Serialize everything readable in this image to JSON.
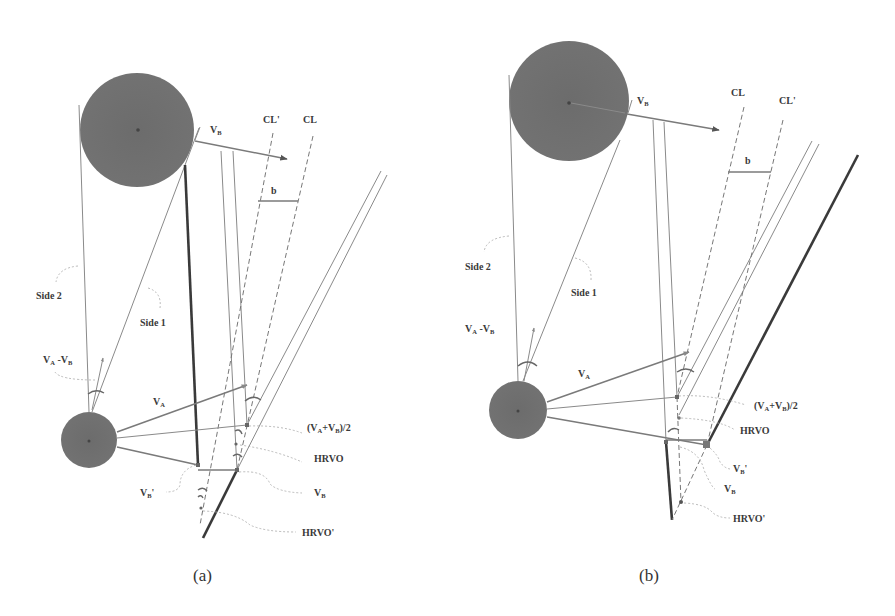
{
  "diagram": {
    "colors": {
      "agent_fill": "#6f6f6f",
      "line": "#8a8a8a",
      "thick_line": "#3a3a3a",
      "text": "#3a3a3a",
      "background": "#ffffff"
    },
    "panels": [
      {
        "caption": "(a)",
        "labels": {
          "vb_top": "V",
          "vb_top_sub": "B",
          "cl_prime": "CL'",
          "cl": "CL",
          "b": "b",
          "side2": "Side 2",
          "side1": "Side 1",
          "va_minus_vb": "V",
          "va_minus_vb_sub1": "A",
          "va_minus_vb_mid": " -V",
          "va_minus_vb_sub2": "B",
          "va": "V",
          "va_sub": "A",
          "avg": "(V",
          "avg_sub1": "A",
          "avg_mid": "+V",
          "avg_sub2": "B",
          "avg_end": ")/2",
          "hrvo": "HRVO",
          "vb_prime": "V",
          "vb_prime_sub": "B",
          "vb_prime_tick": "'",
          "vb": "V",
          "vb_sub": "B",
          "hrvo_prime": "HRVO'"
        }
      },
      {
        "caption": "(b)",
        "labels": {
          "vb_top": "V",
          "vb_top_sub": "B",
          "cl": "CL",
          "cl_prime": "CL'",
          "b": "b",
          "side2": "Side 2",
          "side1": "Side 1",
          "va_minus_vb": "V",
          "va_minus_vb_sub1": "A",
          "va_minus_vb_mid": " -V",
          "va_minus_vb_sub2": "B",
          "va": "V",
          "va_sub": "A",
          "avg": "(V",
          "avg_sub1": "A",
          "avg_mid": "+V",
          "avg_sub2": "B",
          "avg_end": ")/2",
          "hrvo": "HRVO",
          "vb_prime": "V",
          "vb_prime_sub": "B",
          "vb_prime_tick": "'",
          "vb": "V",
          "vb_sub": "B",
          "hrvo_prime": "HRVO'"
        }
      }
    ]
  }
}
